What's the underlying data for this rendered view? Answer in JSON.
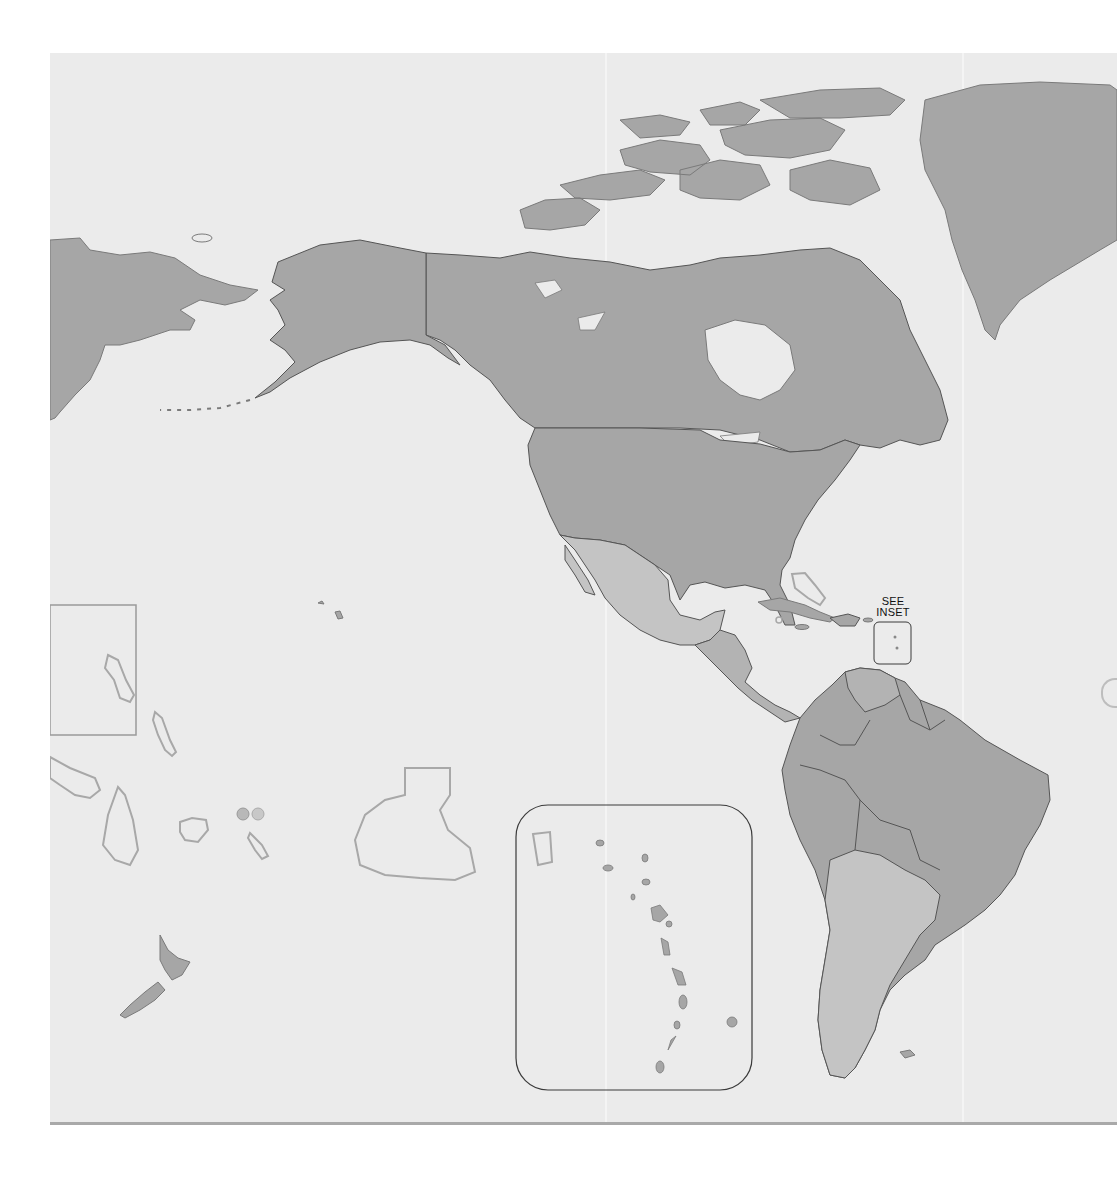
{
  "map": {
    "type": "political outline map",
    "region": "Americas and Pacific",
    "colors": {
      "ocean": "#ebebeb",
      "land_dark": "#a6a6a6",
      "land_light": "#c4c4c4",
      "land_medium": "#b3b3b3",
      "border": "#555555",
      "coastline": "#7a7a7a",
      "outline_island": "#a8a8a8",
      "inset_frame": "#3a3a3a"
    },
    "labels": {
      "see_inset_line1": "SEE",
      "see_inset_line2": "INSET"
    },
    "features": [
      "Greenland",
      "Canada",
      "Alaska (United States)",
      "Russian Far East",
      "Contiguous United States",
      "Mexico",
      "Central America",
      "Caribbean islands",
      "South America",
      "New Zealand",
      "Pacific island outlines",
      "Caribbean inset (Lesser Antilles)"
    ],
    "inset": {
      "title": "Lesser Antilles inset",
      "locator_box": "small rounded rectangle east of Caribbean"
    }
  }
}
